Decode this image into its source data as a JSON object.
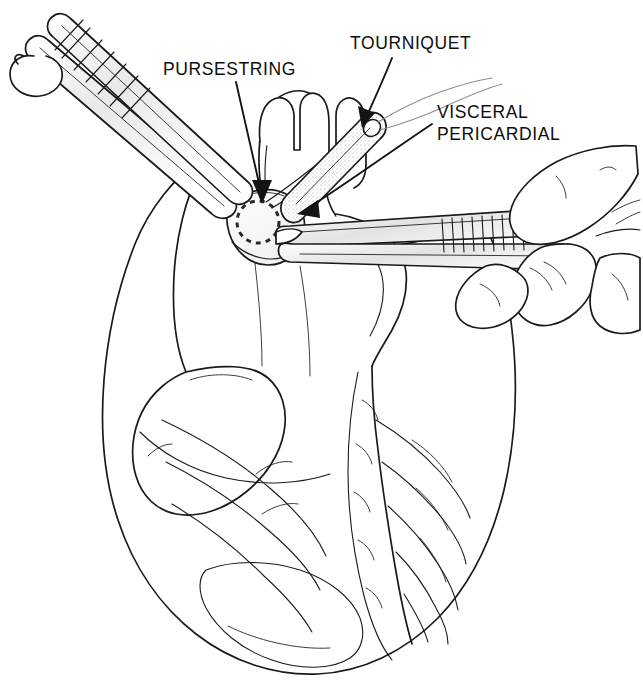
{
  "figure": {
    "background_color": "#ffffff",
    "ink_color": "#1a1a1a",
    "width": 643,
    "height": 695
  },
  "labels": [
    {
      "id": "pursestring",
      "text": "PURSESTRING",
      "x": 163,
      "y": 75,
      "lines": [
        "PURSESTRING"
      ],
      "leader_from": [
        236,
        82
      ],
      "leader_to": [
        262,
        196
      ],
      "arrow": true
    },
    {
      "id": "tourniquet",
      "text": "TOURNIQUET",
      "x": 350,
      "y": 49,
      "lines": [
        "TOURNIQUET"
      ],
      "leader_from": [
        388,
        57
      ],
      "leader_to": [
        366,
        124
      ],
      "arrow": true
    },
    {
      "id": "visceral-pericardial",
      "text": "VISCERAL PERICARDIAL",
      "x": 437,
      "y": 118,
      "lines": [
        "VISCERAL",
        "PERICARDIAL"
      ],
      "leader_from": [
        432,
        125
      ],
      "leader_to": [
        300,
        212
      ],
      "arrow": true
    }
  ],
  "anatomy": [
    {
      "id": "aorta",
      "name": "aorta with arch branches"
    },
    {
      "id": "pulmonary-artery",
      "name": "pulmonary artery"
    },
    {
      "id": "right-atrium",
      "name": "right atrium"
    },
    {
      "id": "right-atrial-appendage",
      "name": "right atrial appendage"
    },
    {
      "id": "right-ventricle",
      "name": "right ventricle"
    },
    {
      "id": "left-ventricle",
      "name": "left ventricle"
    },
    {
      "id": "coronary-arteries",
      "name": "anterior interventricular coronary arteries"
    },
    {
      "id": "epicardial-fat",
      "name": "epicardial fat pad"
    },
    {
      "id": "pericardial-tent",
      "name": "tented visceral pericardium"
    }
  ],
  "instruments": [
    {
      "id": "forceps-upper-left",
      "name": "hemostatic forceps, upper left",
      "grip": "ring handle with ratchet"
    },
    {
      "id": "forceps-right",
      "name": "hemostatic forceps, right",
      "grip": "held in surgeon's hand"
    },
    {
      "id": "tourniquet-tube",
      "name": "tourniquet tube over suture ends"
    },
    {
      "id": "suture-strands",
      "name": "pursestring suture strands"
    },
    {
      "id": "surgeons-hand",
      "name": "surgeon's hand"
    }
  ],
  "markings": {
    "pursestring_circle": {
      "cx": 258,
      "cy": 222,
      "r": 21,
      "style": "dashed"
    }
  }
}
